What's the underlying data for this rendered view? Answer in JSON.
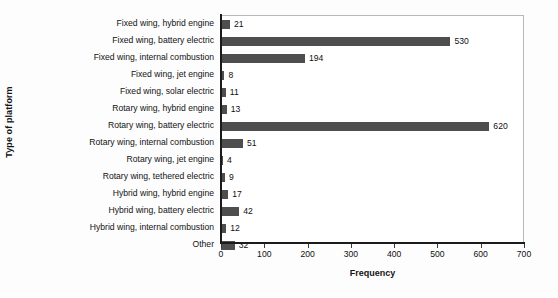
{
  "chart_data": {
    "type": "bar",
    "orientation": "horizontal",
    "title": "",
    "xlabel": "Frequency",
    "ylabel": "Type of platform",
    "xlim": [
      0,
      700
    ],
    "xticks": [
      0,
      100,
      200,
      300,
      400,
      500,
      600,
      700
    ],
    "grid": false,
    "legend": false,
    "bar_color": "#4e4e4e",
    "categories": [
      "Fixed wing, hybrid engine",
      "Fixed wing, battery electric",
      "Fixed wing, internal combustion",
      "Fixed wing, jet engine",
      "Fixed wing, solar electric",
      "Rotary wing, hybrid engine",
      "Rotary wing, battery electric",
      "Rotary wing, internal combustion",
      "Rotary wing, jet engine",
      "Rotary wing, tethered electric",
      "Hybrid wing, hybrid engine",
      "Hybrid wing, battery electric",
      "Hybrid wing, internal combustion",
      "Other"
    ],
    "values": [
      21,
      530,
      194,
      8,
      11,
      13,
      620,
      51,
      4,
      9,
      17,
      42,
      12,
      32
    ],
    "value_labels": [
      "21",
      "530",
      "194",
      "8",
      "11",
      "13",
      "620",
      "51",
      "4",
      "9",
      "17",
      "42",
      "12",
      "32"
    ],
    "xtick_labels": [
      "0",
      "100",
      "200",
      "300",
      "400",
      "500",
      "600",
      "700"
    ]
  }
}
